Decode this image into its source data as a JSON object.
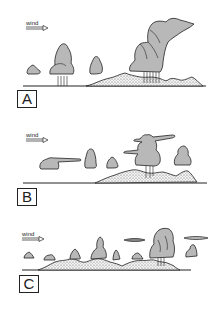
{
  "panels": [
    {
      "id": "A",
      "label": "A",
      "wind_label": "wind"
    },
    {
      "id": "B",
      "label": "B",
      "wind_label": "wind"
    },
    {
      "id": "C",
      "label": "C",
      "wind_label": "wind"
    }
  ],
  "colors": {
    "cloud_fill": "#b8b8b8",
    "outline": "#222222",
    "ground_fill": "#e2e2e2",
    "background": "#ffffff"
  }
}
